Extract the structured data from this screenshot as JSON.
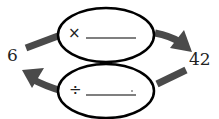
{
  "diagram": {
    "left_value": "6",
    "right_value": "42",
    "top_operation": {
      "symbol": "×",
      "blank": ""
    },
    "bottom_operation": {
      "symbol": "÷",
      "blank": ""
    },
    "colors": {
      "arrow": "#4a4a4a",
      "oval_stroke": "#000000",
      "text": "#222222"
    }
  }
}
